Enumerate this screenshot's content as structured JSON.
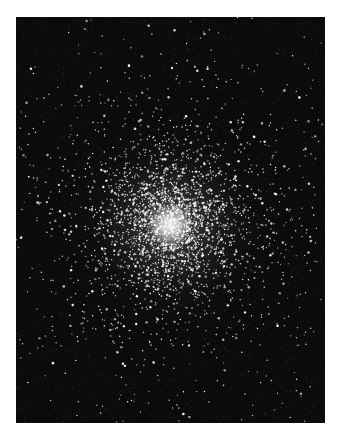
{
  "image": {
    "subject": "globular star cluster photograph",
    "frame": {
      "left": 16,
      "top": 17,
      "width": 309,
      "height": 406
    },
    "colors": {
      "page_background": "#ffffff",
      "sky": "#0b0b0b",
      "star": "#ffffff"
    },
    "cluster_center": {
      "x": 154,
      "y": 208
    },
    "core_radius": 22,
    "halo_radius": 120,
    "field_star_count": 420,
    "cluster_star_count": 2600,
    "seed": 7
  }
}
